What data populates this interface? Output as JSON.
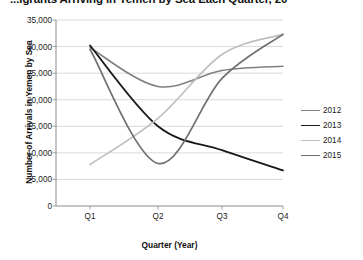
{
  "chart_data": {
    "type": "line",
    "title_visible_text": "...igrants Arriving in Yemen by Sea Each Quarter, 20",
    "xlabel": "Quarter (Year)",
    "ylabel": "Number of Arrivals in Yemen by Sea",
    "categories": [
      "Q1",
      "Q2",
      "Q3",
      "Q4"
    ],
    "ylim": [
      0,
      35000
    ],
    "ytick_labels": [
      "0",
      "5,000",
      "10,000",
      "15,000",
      "20,000",
      "25,000",
      "30,000",
      "35,000"
    ],
    "ytick_values": [
      0,
      5000,
      10000,
      15000,
      20000,
      25000,
      30000,
      35000
    ],
    "grid": true,
    "grid_axis": "y",
    "legend_position": "right",
    "series": [
      {
        "name": "2012",
        "values": [
          29800,
          22500,
          25500,
          26300
        ],
        "color": "#808080",
        "width": 1.6
      },
      {
        "name": "2013",
        "values": [
          30200,
          15000,
          10500,
          6700
        ],
        "color": "#1a1a1a",
        "width": 1.9
      },
      {
        "name": "2014",
        "values": [
          7800,
          16500,
          28500,
          32300
        ],
        "color": "#bfbfbf",
        "width": 1.7
      },
      {
        "name": "2015",
        "values": [
          29500,
          8000,
          24000,
          32300
        ],
        "color": "#707070",
        "width": 1.7
      }
    ]
  },
  "axis": {
    "line_color": "#8c8c8c",
    "grid_color": "#c9c9c9"
  }
}
